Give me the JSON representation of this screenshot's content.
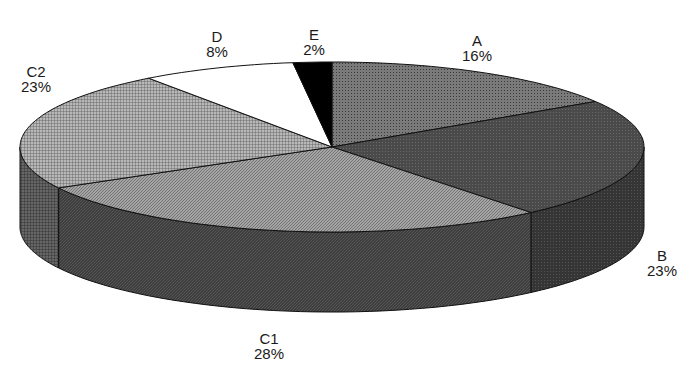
{
  "chart_data": {
    "type": "pie",
    "style": "3d-pie",
    "title": "",
    "start_angle": "12 o'clock",
    "direction": "clockwise",
    "categories": [
      "A",
      "B",
      "C1",
      "C2",
      "D",
      "E"
    ],
    "values": [
      16,
      23,
      28,
      23,
      8,
      2
    ],
    "unit": "%",
    "slices": [
      {
        "label": "A",
        "value": 16,
        "text": "16%",
        "fill": "#6e6e6e",
        "side": "#4a4a4a",
        "pattern": "dots"
      },
      {
        "label": "B",
        "value": 23,
        "text": "23%",
        "fill": "#4f4f4f",
        "side": "#3c3c3c",
        "pattern": "fine"
      },
      {
        "label": "C1",
        "value": 28,
        "text": "28%",
        "fill": "#9a9a9a",
        "side": "#424242",
        "pattern": "diagonal"
      },
      {
        "label": "C2",
        "value": 23,
        "text": "23%",
        "fill": "#a8a8a8",
        "side": "#555555",
        "pattern": "grid"
      },
      {
        "label": "D",
        "value": 8,
        "text": "8%",
        "fill": "#ffffff",
        "side": "#ffffff",
        "pattern": "none"
      },
      {
        "label": "E",
        "value": 2,
        "text": "2%",
        "fill": "#000000",
        "side": "#000000",
        "pattern": "none"
      }
    ],
    "legend": "none",
    "geometry": {
      "cx": 332,
      "cy": 147,
      "rx": 312,
      "ry": 85,
      "depth": 80
    }
  },
  "labels": [
    {
      "name": "A",
      "pct": "16%",
      "x": 477,
      "y": 33
    },
    {
      "name": "B",
      "pct": "23%",
      "x": 662,
      "y": 248
    },
    {
      "name": "C1",
      "pct": "28%",
      "x": 269,
      "y": 331
    },
    {
      "name": "C2",
      "pct": "23%",
      "x": 36,
      "y": 64
    },
    {
      "name": "D",
      "pct": "8%",
      "x": 217,
      "y": 29
    },
    {
      "name": "E",
      "pct": "2%",
      "x": 314,
      "y": 27
    }
  ]
}
